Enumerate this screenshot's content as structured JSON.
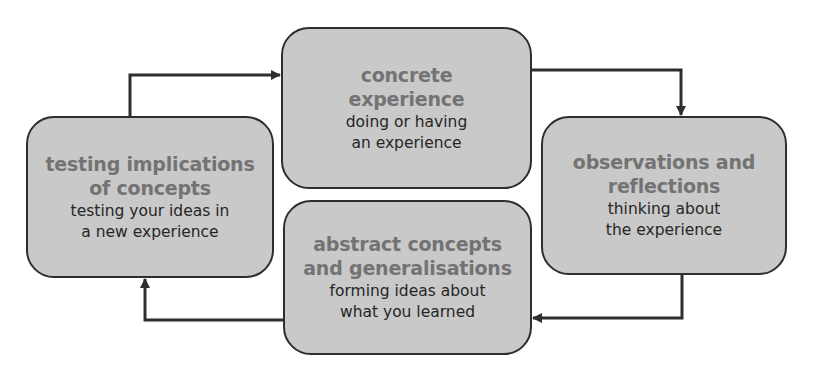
{
  "diagram": {
    "type": "cycle",
    "nodes": [
      {
        "id": "concrete-experience",
        "title": "concrete\nexperience",
        "description": "doing or having\nan experience"
      },
      {
        "id": "observations-reflections",
        "title": "observations and\nreflections",
        "description": "thinking about\nthe experience"
      },
      {
        "id": "abstract-concepts",
        "title": "abstract concepts\nand generalisations",
        "description": "forming ideas about\nwhat you learned"
      },
      {
        "id": "testing-implications",
        "title": "testing implications\nof concepts",
        "description": "testing your ideas in\na new experience"
      }
    ],
    "edges": [
      {
        "from": "concrete-experience",
        "to": "observations-reflections"
      },
      {
        "from": "observations-reflections",
        "to": "abstract-concepts"
      },
      {
        "from": "abstract-concepts",
        "to": "testing-implications"
      },
      {
        "from": "testing-implications",
        "to": "concrete-experience"
      }
    ],
    "colors": {
      "box_fill": "#c9c9c9",
      "box_border": "#2e2e2e",
      "title_text": "#737373",
      "description_text": "#262626",
      "arrow": "#2e2e2e"
    }
  }
}
